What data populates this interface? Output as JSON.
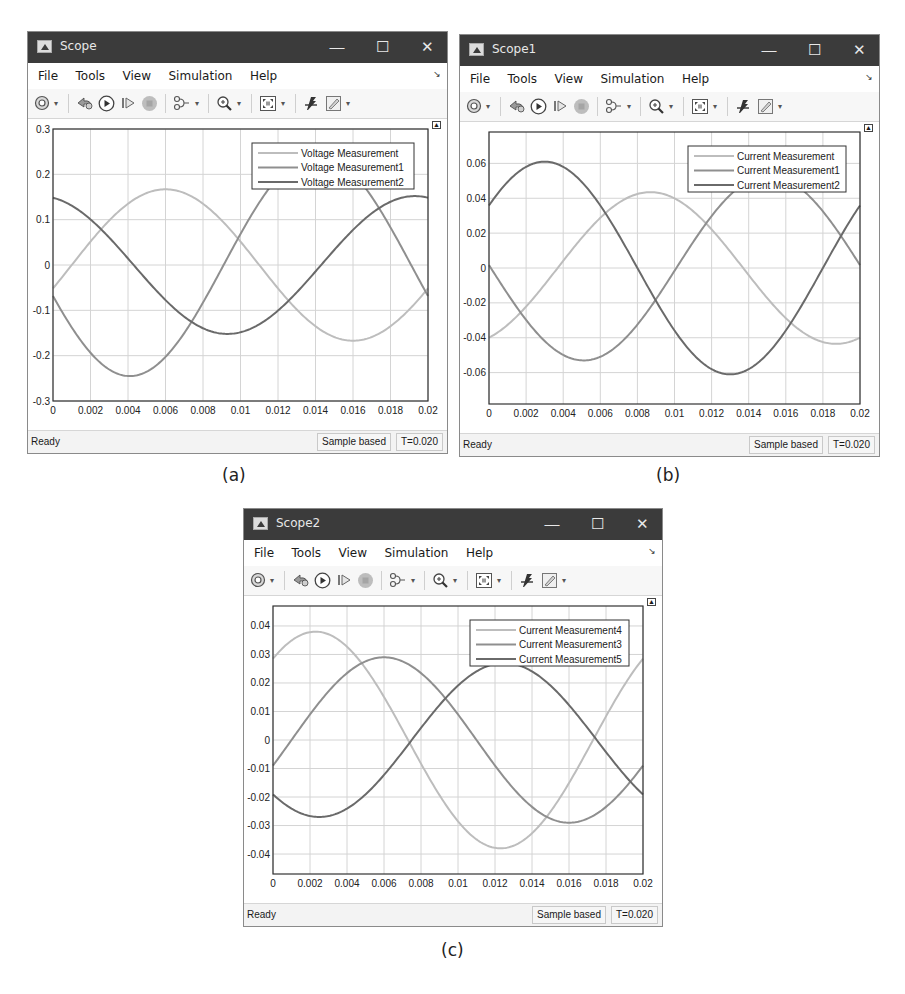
{
  "captions": [
    "(a)",
    "(b)",
    "(c)"
  ],
  "menu": [
    "File",
    "Tools",
    "View",
    "Simulation",
    "Help"
  ],
  "toolbar_icons": [
    "settings-gear-icon",
    "step-back-icon",
    "run-icon",
    "step-forward-icon",
    "stop-icon",
    "signal-routing-icon",
    "zoom-in-icon",
    "autoscale-icon",
    "cursor-measurement-icon",
    "highlight-edit-icon"
  ],
  "window_controls": {
    "minimize": "—",
    "maximize": "☐",
    "close": "✕"
  },
  "colors": {
    "titlebar": "#3b3b3b",
    "series_light": "#bdbdbd",
    "series_medium": "#8f8f8f",
    "series_dark": "#6a6a6a",
    "grid": "#d4d4d4",
    "axes": "#333333"
  },
  "windows": [
    {
      "title": "Scope",
      "status": "Ready",
      "sample_mode": "Sample based",
      "time": "T=0.020"
    },
    {
      "title": "Scope1",
      "status": "Ready",
      "sample_mode": "Sample based",
      "time": "T=0.020"
    },
    {
      "title": "Scope2",
      "status": "Ready",
      "sample_mode": "Sample based",
      "time": "T=0.020"
    }
  ],
  "chart_data": [
    {
      "type": "line",
      "title": "Scope",
      "xlabel": "",
      "ylabel": "",
      "xlim": [
        0,
        0.02
      ],
      "ylim": [
        -0.3,
        0.3
      ],
      "xticks": [
        "0",
        "0.002",
        "0.004",
        "0.006",
        "0.008",
        "0.01",
        "0.012",
        "0.014",
        "0.016",
        "0.018",
        "0.02"
      ],
      "yticks": [
        "-0.3",
        "-0.2",
        "-0.1",
        "0",
        "0.1",
        "0.2",
        "0.3"
      ],
      "ytick_values": [
        -0.3,
        -0.2,
        -0.1,
        0,
        0.1,
        0.2,
        0.3
      ],
      "grid": true,
      "legend_position": "upper right",
      "x": [
        0,
        0.002,
        0.004,
        0.006,
        0.008,
        0.01,
        0.012,
        0.014,
        0.016,
        0.018,
        0.02
      ],
      "series": [
        {
          "name": "Voltage Measurement",
          "shade": "light",
          "amp": 0.167,
          "peak_t": 0.006,
          "offset": 0,
          "values": [
            -0.1,
            0.05,
            0.155,
            0.165,
            0.06,
            -0.09,
            -0.16,
            -0.168,
            -0.105,
            0.02,
            0.09
          ]
        },
        {
          "name": "Voltage Measurement1",
          "shade": "medium",
          "amp": 0.245,
          "peak_t": 0.0141,
          "offset": 0,
          "values": [
            0.0,
            -0.185,
            -0.245,
            -0.19,
            -0.05,
            0.12,
            0.23,
            0.245,
            0.19,
            0.02,
            -0.235
          ]
        },
        {
          "name": "Voltage Measurement2",
          "shade": "dark",
          "amp": 0.152,
          "peak_t": 0.0193,
          "offset": 0,
          "values": [
            0.105,
            0.152,
            0.115,
            0.025,
            -0.08,
            -0.152,
            -0.135,
            -0.05,
            0.06,
            0.15,
            0.135
          ]
        }
      ]
    },
    {
      "type": "line",
      "title": "Scope1",
      "xlabel": "",
      "ylabel": "",
      "xlim": [
        0,
        0.02
      ],
      "ylim": [
        -0.078,
        0.078
      ],
      "xticks": [
        "0",
        "0.002",
        "0.004",
        "0.006",
        "0.008",
        "0.01",
        "0.012",
        "0.014",
        "0.016",
        "0.018",
        "0.02"
      ],
      "yticks": [
        "-0.06",
        "-0.04",
        "-0.02",
        "0",
        "0.02",
        "0.04",
        "0.06"
      ],
      "ytick_values": [
        -0.06,
        -0.04,
        -0.02,
        0,
        0.02,
        0.04,
        0.06
      ],
      "grid": true,
      "legend_position": "upper right",
      "x": [
        0,
        0.002,
        0.004,
        0.006,
        0.008,
        0.01,
        0.012,
        0.014,
        0.016,
        0.018,
        0.02
      ],
      "series": [
        {
          "name": "Current Measurement",
          "shade": "light",
          "amp": 0.0435,
          "peak_t": 0.0087,
          "offset": 0,
          "values": [
            -0.043,
            -0.036,
            -0.005,
            0.03,
            0.043,
            0.035,
            0.005,
            -0.028,
            -0.043,
            -0.04,
            -0.02
          ]
        },
        {
          "name": "Current Measurement1",
          "shade": "medium",
          "amp": 0.053,
          "peak_t": 0.0151,
          "offset": 0,
          "values": [
            0.017,
            -0.025,
            -0.048,
            -0.05,
            -0.02,
            0.02,
            0.045,
            0.052,
            0.04,
            0.0,
            -0.042
          ]
        },
        {
          "name": "Current Measurement2",
          "shade": "dark",
          "amp": 0.061,
          "peak_t": 0.003,
          "offset": 0,
          "values": [
            0.027,
            0.058,
            0.055,
            0.02,
            -0.022,
            -0.055,
            -0.06,
            -0.03,
            0.01,
            0.045,
            0.06
          ]
        }
      ]
    },
    {
      "type": "line",
      "title": "Scope2",
      "xlabel": "",
      "ylabel": "",
      "xlim": [
        0,
        0.02
      ],
      "ylim": [
        -0.047,
        0.047
      ],
      "xticks": [
        "0",
        "0.002",
        "0.004",
        "0.006",
        "0.008",
        "0.01",
        "0.012",
        "0.014",
        "0.016",
        "0.018",
        "0.02"
      ],
      "yticks": [
        "-0.04",
        "-0.03",
        "-0.02",
        "-0.01",
        "0",
        "0.01",
        "0.02",
        "0.03",
        "0.04"
      ],
      "ytick_values": [
        -0.04,
        -0.03,
        -0.02,
        -0.01,
        0,
        0.01,
        0.02,
        0.03,
        0.04
      ],
      "grid": true,
      "legend_position": "upper right",
      "x": [
        0,
        0.002,
        0.004,
        0.006,
        0.008,
        0.01,
        0.012,
        0.014,
        0.016,
        0.018,
        0.02
      ],
      "series": [
        {
          "name": "Current Measurement4",
          "shade": "light",
          "amp": 0.038,
          "peak_t": 0.0023,
          "offset": 0,
          "values": [
            0.025,
            0.038,
            0.03,
            0.005,
            -0.025,
            -0.038,
            -0.03,
            -0.005,
            0.022,
            0.037,
            0.035
          ]
        },
        {
          "name": "Current Measurement3",
          "shade": "medium",
          "amp": 0.029,
          "peak_t": 0.006,
          "offset": 0,
          "values": [
            -0.017,
            0.005,
            0.025,
            0.029,
            0.015,
            -0.01,
            -0.027,
            -0.028,
            -0.015,
            0.005,
            0.015
          ]
        },
        {
          "name": "Current Measurement5",
          "shade": "dark",
          "amp": 0.027,
          "peak_t": 0.0125,
          "offset": 0,
          "values": [
            0.0,
            -0.02,
            -0.027,
            -0.021,
            0.0,
            0.019,
            0.027,
            0.02,
            0.0,
            -0.015,
            -0.026
          ]
        }
      ]
    }
  ]
}
